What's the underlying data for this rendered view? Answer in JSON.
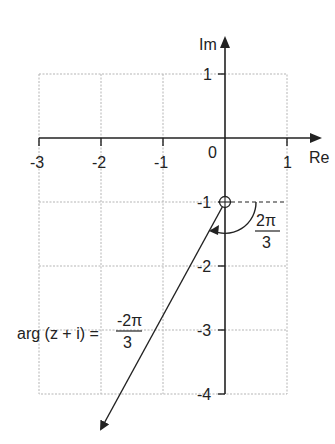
{
  "diagram": {
    "title": "",
    "axes": {
      "x_label": "Re",
      "y_label": "Im",
      "origin_label": "0",
      "x_ticks": [
        "-3",
        "-2",
        "-1",
        "1"
      ],
      "y_ticks": [
        "1",
        "-1",
        "-2",
        "-3",
        "-4"
      ]
    },
    "point": {
      "label": "-i",
      "re": 0,
      "im": -1,
      "marker": "circled-cross"
    },
    "angle": {
      "numerator": "2π",
      "denominator": "3"
    },
    "equation": {
      "lhs": "arg (z + i) =",
      "numerator": "-2π",
      "denominator": "3"
    }
  }
}
